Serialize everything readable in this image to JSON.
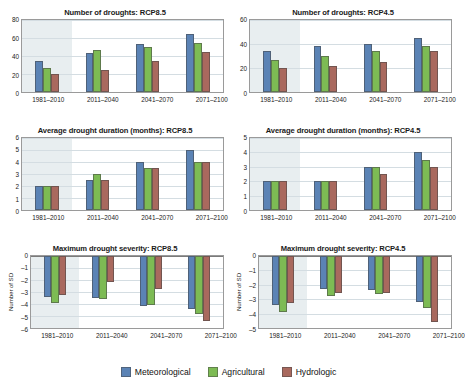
{
  "legend": {
    "items": [
      {
        "label": "Meteorological",
        "color": "#5b83b5"
      },
      {
        "label": "Agricultural",
        "color": "#7dbb54"
      },
      {
        "label": "Hydrologic",
        "color": "#a9695e"
      }
    ]
  },
  "categories": [
    "1981–2010",
    "2011–2040",
    "2041–2070",
    "2071–2100"
  ],
  "chart_data": [
    {
      "id": "number-droughts-rcp85",
      "type": "bar",
      "title": "Number of droughts: RCP8.5",
      "xlabel": "",
      "ylabel": "",
      "ylim": [
        0,
        80
      ],
      "yticks": [
        0,
        20,
        40,
        60,
        80
      ],
      "grid": true,
      "legend_position": "figure-bottom",
      "shaded_baseline_category": "1981–2010",
      "categories": [
        "1981–2010",
        "2011–2040",
        "2041–2070",
        "2071–2100"
      ],
      "series": [
        {
          "name": "Meteorological",
          "color": "#5b83b5",
          "values": [
            34,
            43,
            53,
            64
          ]
        },
        {
          "name": "Agricultural",
          "color": "#7dbb54",
          "values": [
            27,
            47,
            50,
            55
          ]
        },
        {
          "name": "Hydrologic",
          "color": "#a9695e",
          "values": [
            20,
            25,
            34,
            44
          ]
        }
      ]
    },
    {
      "id": "number-droughts-rcp45",
      "type": "bar",
      "title": "Number of droughts: RCP4.5",
      "xlabel": "",
      "ylabel": "",
      "ylim": [
        0,
        60
      ],
      "yticks": [
        0,
        20,
        40,
        60
      ],
      "grid": true,
      "legend_position": "figure-bottom",
      "shaded_baseline_category": "1981–2010",
      "categories": [
        "1981–2010",
        "2011–2040",
        "2041–2070",
        "2071–2100"
      ],
      "series": [
        {
          "name": "Meteorological",
          "color": "#5b83b5",
          "values": [
            34,
            38,
            40,
            45
          ]
        },
        {
          "name": "Agricultural",
          "color": "#7dbb54",
          "values": [
            27,
            30,
            34,
            38.5
          ]
        },
        {
          "name": "Hydrologic",
          "color": "#a9695e",
          "values": [
            20,
            22,
            25,
            34.5
          ]
        }
      ]
    },
    {
      "id": "avg-duration-rcp85",
      "type": "bar",
      "title": "Average drought duration (months): RCP8.5",
      "xlabel": "",
      "ylabel": "",
      "ylim": [
        0,
        6
      ],
      "yticks": [
        0,
        1,
        2,
        3,
        4,
        5,
        6
      ],
      "grid": true,
      "legend_position": "figure-bottom",
      "shaded_baseline_category": "1981–2010",
      "categories": [
        "1981–2010",
        "2011–2040",
        "2041–2070",
        "2071–2100"
      ],
      "series": [
        {
          "name": "Meteorological",
          "color": "#5b83b5",
          "values": [
            2,
            2.5,
            4,
            5
          ]
        },
        {
          "name": "Agricultural",
          "color": "#7dbb54",
          "values": [
            2,
            3,
            3.5,
            4
          ]
        },
        {
          "name": "Hydrologic",
          "color": "#a9695e",
          "values": [
            2,
            2.5,
            3.5,
            4
          ]
        }
      ]
    },
    {
      "id": "avg-duration-rcp45",
      "type": "bar",
      "title": "Average drought duration (months): RCP4.5",
      "xlabel": "",
      "ylabel": "",
      "ylim": [
        0,
        5
      ],
      "yticks": [
        0,
        1,
        2,
        3,
        4,
        5
      ],
      "grid": true,
      "legend_position": "figure-bottom",
      "shaded_baseline_category": "1981–2010",
      "categories": [
        "1981–2010",
        "2011–2040",
        "2041–2070",
        "2071–2100"
      ],
      "series": [
        {
          "name": "Meteorological",
          "color": "#5b83b5",
          "values": [
            2,
            2,
            3,
            4
          ]
        },
        {
          "name": "Agricultural",
          "color": "#7dbb54",
          "values": [
            2,
            2,
            3,
            3.5
          ]
        },
        {
          "name": "Hydrologic",
          "color": "#a9695e",
          "values": [
            2,
            2,
            2.5,
            3
          ]
        }
      ]
    },
    {
      "id": "max-severity-rcp85",
      "type": "bar",
      "title": "Maximum drought severity: RCP8.5",
      "xlabel": "",
      "ylabel": "Number of SD",
      "ylim": [
        -6,
        0
      ],
      "yticks": [
        0,
        -1,
        -2,
        -3,
        -4,
        -5,
        -6
      ],
      "grid": true,
      "legend_position": "figure-bottom",
      "shaded_baseline_category": "1981–2010",
      "categories": [
        "1981–2010",
        "2011–2040",
        "2041–2070",
        "2071–2100"
      ],
      "series": [
        {
          "name": "Meteorological",
          "color": "#5b83b5",
          "values": [
            -3.4,
            -3.5,
            -4.2,
            -4.4
          ]
        },
        {
          "name": "Agricultural",
          "color": "#7dbb54",
          "values": [
            -3.95,
            -3.6,
            -4.05,
            -4.85
          ]
        },
        {
          "name": "Hydrologic",
          "color": "#a9695e",
          "values": [
            -3.25,
            -2.15,
            -2.75,
            -5.4
          ]
        }
      ]
    },
    {
      "id": "max-severity-rcp45",
      "type": "bar",
      "title": "Maximum drought severity: RCP4.5",
      "xlabel": "",
      "ylabel": "Number of SD",
      "ylim": [
        -5,
        0
      ],
      "yticks": [
        0,
        -1,
        -2,
        -3,
        -4,
        -5
      ],
      "grid": true,
      "legend_position": "figure-bottom",
      "shaded_baseline_category": "1981–2010",
      "categories": [
        "1981–2010",
        "2011–2040",
        "2041–2070",
        "2071–2100"
      ],
      "series": [
        {
          "name": "Meteorological",
          "color": "#5b83b5",
          "values": [
            -3.4,
            -2.3,
            -2.35,
            -3.2
          ]
        },
        {
          "name": "Agricultural",
          "color": "#7dbb54",
          "values": [
            -3.9,
            -2.8,
            -2.65,
            -3.6
          ]
        },
        {
          "name": "Hydrologic",
          "color": "#a9695e",
          "values": [
            -3.25,
            -2.6,
            -2.6,
            -4.55
          ]
        }
      ]
    }
  ]
}
